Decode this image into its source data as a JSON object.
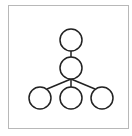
{
  "diagram": {
    "type": "tree",
    "frame_color": "#b8b8b8",
    "stroke_color": "#222222",
    "nodes": [
      {
        "id": "root",
        "cx": 71,
        "cy": 40,
        "r": 11
      },
      {
        "id": "hub",
        "cx": 71,
        "cy": 68,
        "r": 11
      },
      {
        "id": "leaf-left",
        "cx": 40,
        "cy": 98,
        "r": 11
      },
      {
        "id": "leaf-center",
        "cx": 71,
        "cy": 98,
        "r": 11
      },
      {
        "id": "leaf-right",
        "cx": 102,
        "cy": 98,
        "r": 11
      }
    ],
    "edges": [
      [
        "root",
        "hub"
      ],
      [
        "hub",
        "leaf-left"
      ],
      [
        "hub",
        "leaf-center"
      ],
      [
        "hub",
        "leaf-right"
      ]
    ]
  }
}
